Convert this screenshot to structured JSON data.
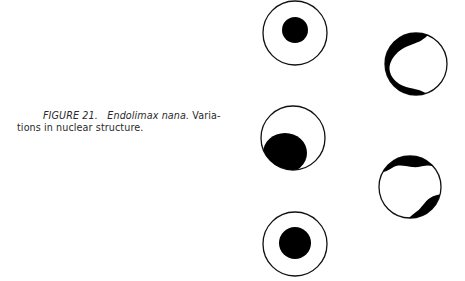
{
  "caption": {
    "figure_label": "FIGURE 21.",
    "species": "Endolimax nana.",
    "text_line1_end": "Varia-",
    "text_line2": "tions in nuclear structure."
  },
  "figure": {
    "nuclei": [
      {
        "id": 1,
        "cx": 295,
        "cy": 33,
        "r": 32,
        "pattern": "central dot"
      },
      {
        "id": 2,
        "cx": 416,
        "cy": 64,
        "r": 31,
        "pattern": "crescent chromatin on left side"
      },
      {
        "id": 3,
        "cx": 293,
        "cy": 138,
        "r": 32,
        "pattern": "large eccentric mass lower-left"
      },
      {
        "id": 4,
        "cx": 410,
        "cy": 187,
        "r": 31,
        "pattern": "two peripheral caps top and lower-right"
      },
      {
        "id": 5,
        "cx": 295,
        "cy": 244,
        "r": 32,
        "pattern": "large central dot"
      }
    ]
  }
}
